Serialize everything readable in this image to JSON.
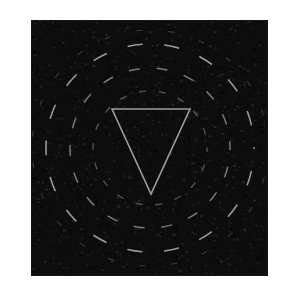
{
  "canvas": {
    "width": 292,
    "height": 300,
    "background_color": "#ffffff",
    "description": "Grainy dark square image containing a downward-pointing outlined triangle encircled by concentric dashed rings"
  },
  "panel": {
    "name": "dark-noise-square",
    "x": 31,
    "y": 20,
    "width": 237,
    "height": 256,
    "fill_color": "#0d0d0d",
    "noise": {
      "enabled": true,
      "grain_color_light": "#3a3a3a",
      "grain_color_dark": "#000000",
      "density": 2600,
      "seed": 20240517
    },
    "edge_color": "#151515"
  },
  "figure": {
    "center_x": 150,
    "center_y": 148,
    "triangle": {
      "label": "inverted-triangle",
      "orientation": "pointing-down",
      "stroke_color": "#9c9c9c",
      "stroke_width": 1.6,
      "fill": "none",
      "points": "112,109 190,109 151,194",
      "vertex_top_left": [
        112,
        109
      ],
      "vertex_top_right": [
        190,
        109
      ],
      "vertex_bottom": [
        151,
        194
      ]
    },
    "rings": [
      {
        "label": "inner-dashed-ring",
        "radius": 57,
        "stroke_color": "#6e6e6e",
        "stroke_width": 1.3,
        "dash_pattern": "7 13",
        "dash_offset": 3,
        "opacity": 0.75
      },
      {
        "label": "middle-dashed-ring",
        "radius": 80,
        "stroke_color": "#8c8c8c",
        "stroke_width": 1.5,
        "dash_pattern": "11 17",
        "dash_offset": 9,
        "opacity": 0.85
      },
      {
        "label": "outer-dashed-ring",
        "radius": 104,
        "stroke_color": "#a5a5a5",
        "stroke_width": 1.6,
        "dash_pattern": "15 22",
        "dash_offset": 14,
        "opacity": 0.92
      },
      {
        "label": "outermost-faint-ring",
        "radius": 118,
        "stroke_color": "#5c5c5c",
        "stroke_width": 1.2,
        "dash_pattern": "6 26",
        "dash_offset": 2,
        "opacity": 0.55
      }
    ]
  },
  "chart_data": {
    "type": "scatter",
    "title": "",
    "xlabel": "",
    "ylabel": "",
    "series": [
      {
        "name": "inverted-triangle-outline",
        "x": [
          112,
          190,
          151,
          112
        ],
        "y": [
          109,
          109,
          194,
          109
        ]
      },
      {
        "name": "ring-radii",
        "x": [
          1,
          2,
          3,
          4
        ],
        "y": [
          57,
          80,
          104,
          118
        ]
      }
    ],
    "categories": [
      "inner-ring",
      "middle-ring",
      "outer-ring",
      "outermost-ring"
    ],
    "values": [
      57,
      80,
      104,
      118
    ],
    "grid": false,
    "legend_position": "none"
  }
}
